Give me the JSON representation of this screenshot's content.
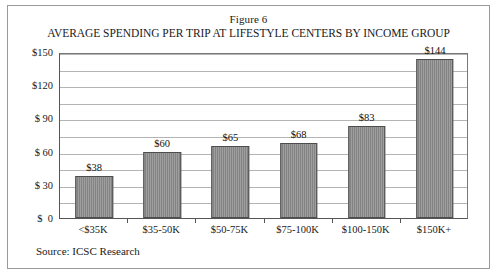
{
  "figure": {
    "number_label": "Figure 6",
    "source_note": "Source: ICSC Research"
  },
  "chart_data": {
    "type": "bar",
    "title": "AVERAGE SPENDING PER TRIP AT LIFESTYLE CENTERS BY INCOME GROUP",
    "subtitle": "Figure 6",
    "xlabel": "",
    "ylabel": "",
    "categories": [
      "<$35K",
      "$35-50K",
      "$50-75K",
      "$75-100K",
      "$100-150K",
      "$150K+"
    ],
    "values": [
      38,
      60,
      65,
      68,
      83,
      144
    ],
    "value_labels": [
      "$38",
      "$60",
      "$65",
      "$68",
      "$83",
      "$144"
    ],
    "ylim": [
      0,
      150
    ],
    "ytick_values": [
      150,
      120,
      90,
      60,
      30,
      0
    ],
    "ytick_labels": [
      "$150",
      "$120",
      "$ 90",
      "$ 60",
      "$ 30",
      "$  0"
    ],
    "gridline_values": [
      150,
      135,
      120,
      105,
      90,
      75,
      60,
      45,
      30,
      15
    ],
    "grid": true,
    "legend": "none",
    "bar_color": "#8a8a8a",
    "bar_border_color": "#4d4d4d",
    "gridline_color": "#b4b4b4",
    "plot_border_color": "#555555",
    "background_color": "#ffffff"
  }
}
